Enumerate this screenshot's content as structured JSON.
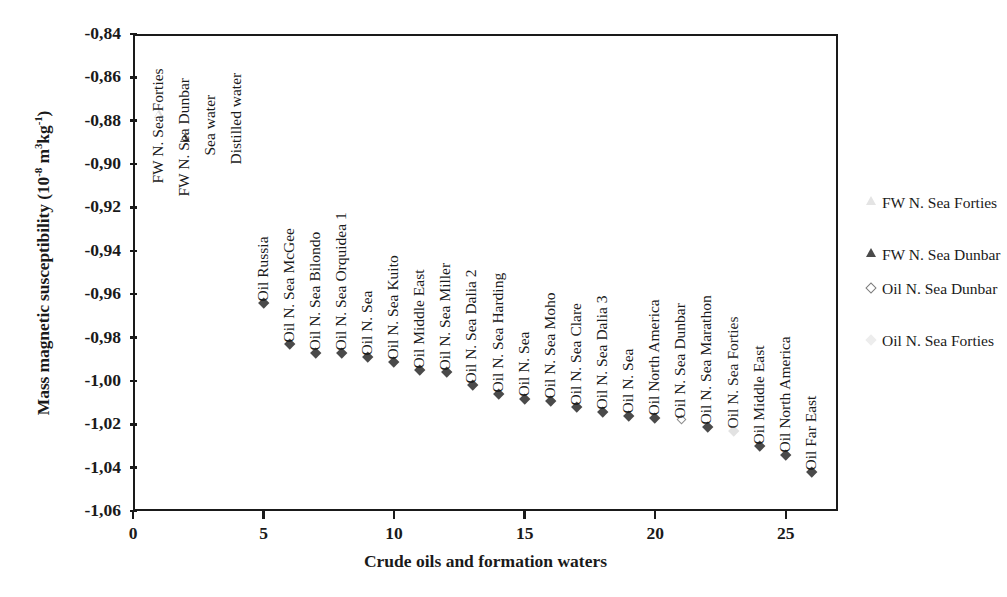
{
  "chart_data": {
    "type": "scatter",
    "title": "",
    "xlabel": "Crude oils and formation waters",
    "ylabel": "Mass magnetic susceptibility (10-8 m3kg-1)",
    "ylabel_parts": {
      "main": "Mass magnetic susceptibility (10",
      "sup1": "-8",
      "mid": " m",
      "sup2": "3",
      "unit": "kg",
      "sup3": "-1",
      "close": ")"
    },
    "xlim": [
      0,
      27
    ],
    "ylim": [
      -1.06,
      -0.84
    ],
    "grid": false,
    "legend_position": "right",
    "xticks": [
      "0",
      "5",
      "10",
      "15",
      "20",
      "25"
    ],
    "xtick_values": [
      0,
      5,
      10,
      15,
      20,
      25
    ],
    "yticks": [
      "-0,84",
      "-0,86",
      "-0,88",
      "-0,90",
      "-0,92",
      "-0,94",
      "-0,96",
      "-0,98",
      "-1,00",
      "-1,02",
      "-1,04",
      "-1,06"
    ],
    "ytick_values": [
      -0.84,
      -0.86,
      -0.88,
      -0.9,
      -0.92,
      -0.94,
      -0.96,
      -0.98,
      -1.0,
      -1.02,
      -1.04,
      -1.06
    ],
    "legend": [
      {
        "label": "FW N. Sea Forties",
        "marker": "triangle-faint"
      },
      {
        "label": "FW N. Sea Dunbar",
        "marker": "triangle-open"
      },
      {
        "label": "Oil N. Sea Dunbar",
        "marker": "diamond-open"
      },
      {
        "label": "Oil N. Sea Forties",
        "marker": "diamond-faint"
      }
    ],
    "points": [
      {
        "x": 1,
        "y": -0.877,
        "label": "FW N. Sea Forties",
        "marker": "triangle-faint",
        "label_anchor_y": -0.902
      },
      {
        "x": 2,
        "y": -0.886,
        "label": "FW N. Sea Dunbar",
        "marker": "triangle-open",
        "label_anchor_y": -0.908
      },
      {
        "x": 3,
        "y": -0.89,
        "label": "Sea water",
        "marker": "none",
        "label_anchor_y": -0.889
      },
      {
        "x": 4,
        "y": -0.894,
        "label": "Distilled water",
        "marker": "none",
        "label_anchor_y": -0.893
      },
      {
        "x": 5,
        "y": -0.964,
        "label": "Oil Russia",
        "marker": "diamond",
        "label_anchor_y": -0.956
      },
      {
        "x": 6,
        "y": -0.983,
        "label": "Oil N. Sea McGee",
        "marker": "diamond",
        "label_anchor_y": -0.975
      },
      {
        "x": 7,
        "y": -0.987,
        "label": "Oil N. Sea Bilondo",
        "marker": "diamond",
        "label_anchor_y": -0.979
      },
      {
        "x": 8,
        "y": -0.987,
        "label": "Oil N. Sea Orquidea 1",
        "marker": "diamond",
        "label_anchor_y": -0.979
      },
      {
        "x": 9,
        "y": -0.989,
        "label": "Oil N. Sea",
        "marker": "diamond",
        "label_anchor_y": -0.981
      },
      {
        "x": 10,
        "y": -0.991,
        "label": "Oil N. Sea Kuito",
        "marker": "diamond",
        "label_anchor_y": -0.983
      },
      {
        "x": 11,
        "y": -0.995,
        "label": "Oil Middle East",
        "marker": "diamond",
        "label_anchor_y": -0.987
      },
      {
        "x": 12,
        "y": -0.996,
        "label": "Oil N. Sea Miller",
        "marker": "diamond",
        "label_anchor_y": -0.988
      },
      {
        "x": 13,
        "y": -1.002,
        "label": "Oil N. Sea Dalia 2",
        "marker": "diamond",
        "label_anchor_y": -0.994
      },
      {
        "x": 14,
        "y": -1.006,
        "label": "Oil N. Sea Harding",
        "marker": "diamond",
        "label_anchor_y": -0.998
      },
      {
        "x": 15,
        "y": -1.008,
        "label": "Oil N. Sea",
        "marker": "diamond",
        "label_anchor_y": -1.0
      },
      {
        "x": 16,
        "y": -1.009,
        "label": "Oil N. Sea Moho",
        "marker": "diamond",
        "label_anchor_y": -1.001
      },
      {
        "x": 17,
        "y": -1.012,
        "label": "Oil N. Sea Clare",
        "marker": "diamond",
        "label_anchor_y": -1.004
      },
      {
        "x": 18,
        "y": -1.014,
        "label": "Oil N. Sea Dalia 3",
        "marker": "diamond",
        "label_anchor_y": -1.006
      },
      {
        "x": 19,
        "y": -1.016,
        "label": "Oil N. Sea",
        "marker": "diamond",
        "label_anchor_y": -1.008
      },
      {
        "x": 20,
        "y": -1.017,
        "label": "Oil North America",
        "marker": "diamond",
        "label_anchor_y": -1.009
      },
      {
        "x": 21,
        "y": -1.018,
        "label": "Oil N. Sea Dunbar",
        "marker": "diamond-open",
        "label_anchor_y": -1.01
      },
      {
        "x": 22,
        "y": -1.021,
        "label": "Oil N. Sea Marathon",
        "marker": "diamond",
        "label_anchor_y": -1.013
      },
      {
        "x": 23,
        "y": -1.023,
        "label": "Oil N. Sea Forties",
        "marker": "diamond-faint",
        "label_anchor_y": -1.015
      },
      {
        "x": 24,
        "y": -1.03,
        "label": "Oil Middle East",
        "marker": "diamond",
        "label_anchor_y": -1.022
      },
      {
        "x": 25,
        "y": -1.034,
        "label": "Oil North America",
        "marker": "diamond",
        "label_anchor_y": -1.026
      },
      {
        "x": 26,
        "y": -1.042,
        "label": "Oil Far East",
        "marker": "diamond",
        "label_anchor_y": -1.034
      }
    ]
  }
}
